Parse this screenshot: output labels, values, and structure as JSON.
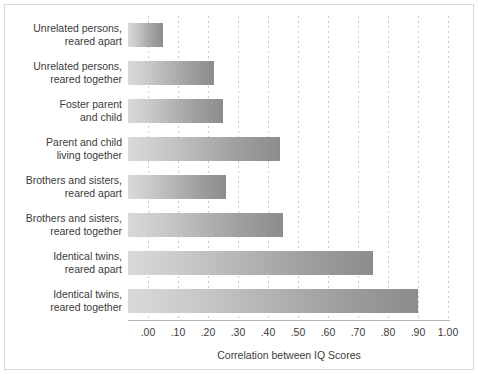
{
  "chart_data": {
    "type": "bar",
    "orientation": "horizontal",
    "title": "",
    "xlabel": "Correlation between IQ Scores",
    "ylabel": "",
    "xlim": [
      0.0,
      1.0
    ],
    "xticks": [
      0.0,
      0.1,
      0.2,
      0.3,
      0.4,
      0.5,
      0.6,
      0.7,
      0.8,
      0.9,
      1.0
    ],
    "xticklabels": [
      ".00",
      ".10",
      ".20",
      ".30",
      ".40",
      ".50",
      ".60",
      ".70",
      ".80",
      ".90",
      "1.00"
    ],
    "grid": "vertical-dotted",
    "legend": "none",
    "bar_color_start": "#d9d9d9",
    "bar_color_end": "#8c8c8c",
    "categories": [
      "Unrelated persons,\nreared apart",
      "Unrelated persons,\nreared together",
      "Foster parent\nand child",
      "Parent and child\nliving together",
      "Brothers and sisters,\nreared apart",
      "Brothers and sisters,\nreared together",
      "Identical twins,\nreared apart",
      "Identical twins,\nreared together"
    ],
    "values": [
      0.05,
      0.22,
      0.25,
      0.44,
      0.26,
      0.45,
      0.75,
      0.9
    ]
  }
}
